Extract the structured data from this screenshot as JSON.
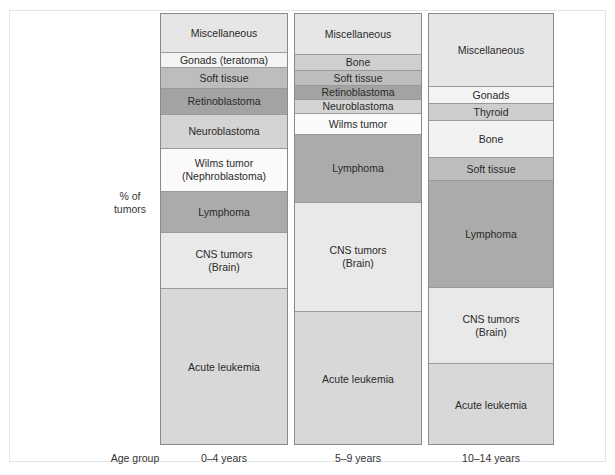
{
  "chart_data": {
    "type": "bar",
    "subtype": "stacked-100-percent",
    "title": "",
    "ylabel": "% of tumors",
    "xlabel": "Age group",
    "categories": [
      "0–4 years",
      "5–9 years",
      "10–14 years"
    ],
    "note": "Values are approximate percentages estimated from segment heights (no axis ticks shown).",
    "columns": [
      {
        "label": "0–4 years",
        "segments": [
          {
            "name": "Miscellaneous",
            "label": "Miscellaneous",
            "value": 9,
            "color": "#e6e6e6"
          },
          {
            "name": "Gonads (teratoma)",
            "label": "Gonads (teratoma)",
            "value": 3.5,
            "color": "#f4f4f4"
          },
          {
            "name": "Soft tissue",
            "label": "Soft tissue",
            "value": 5,
            "color": "#bdbdbd"
          },
          {
            "name": "Retinoblastoma",
            "label": "Retinoblastoma",
            "value": 6,
            "color": "#a3a3a3"
          },
          {
            "name": "Neuroblastoma",
            "label": "Neuroblastoma",
            "value": 8,
            "color": "#d4d4d4"
          },
          {
            "name": "Wilms tumor (Nephroblastoma)",
            "label": "Wilms tumor\n(Nephroblastoma)",
            "value": 10,
            "color": "#fafafa"
          },
          {
            "name": "Lymphoma",
            "label": "Lymphoma",
            "value": 9.5,
            "color": "#ababab"
          },
          {
            "name": "CNS tumors (Brain)",
            "label": "CNS tumors\n(Brain)",
            "value": 13,
            "color": "#e9e9e9"
          },
          {
            "name": "Acute leukemia",
            "label": "Acute leukemia",
            "value": 36,
            "color": "#d8d8d8"
          }
        ]
      },
      {
        "label": "5–9 years",
        "segments": [
          {
            "name": "Miscellaneous",
            "label": "Miscellaneous",
            "value": 9.5,
            "color": "#e6e6e6"
          },
          {
            "name": "Bone",
            "label": "Bone",
            "value": 3.5,
            "color": "#cfcfcf"
          },
          {
            "name": "Soft tissue",
            "label": "Soft tissue",
            "value": 3.5,
            "color": "#bdbdbd"
          },
          {
            "name": "Retinoblastoma",
            "label": "Retinoblastoma",
            "value": 3,
            "color": "#a3a3a3"
          },
          {
            "name": "Neuroblastoma",
            "label": "Neuroblastoma",
            "value": 3,
            "color": "#d4d4d4"
          },
          {
            "name": "Wilms tumor",
            "label": "Wilms tumor",
            "value": 5,
            "color": "#fafafa"
          },
          {
            "name": "Lymphoma",
            "label": "Lymphoma",
            "value": 16,
            "color": "#ababab"
          },
          {
            "name": "CNS tumors (Brain)",
            "label": "CNS tumors\n(Brain)",
            "value": 25,
            "color": "#e9e9e9"
          },
          {
            "name": "Acute leukemia",
            "label": "Acute leukemia",
            "value": 31,
            "color": "#d8d8d8"
          }
        ]
      },
      {
        "label": "10–14 years",
        "segments": [
          {
            "name": "Miscellaneous",
            "label": "Miscellaneous",
            "value": 17,
            "color": "#e6e6e6"
          },
          {
            "name": "Gonads",
            "label": "Gonads",
            "value": 4,
            "color": "#f4f4f4"
          },
          {
            "name": "Thyroid",
            "label": "Thyroid",
            "value": 4,
            "color": "#cdcdcd"
          },
          {
            "name": "Bone",
            "label": "Bone",
            "value": 8.5,
            "color": "#f2f2f2"
          },
          {
            "name": "Soft tissue",
            "label": "Soft tissue",
            "value": 5.5,
            "color": "#bdbdbd"
          },
          {
            "name": "Lymphoma",
            "label": "Lymphoma",
            "value": 24.5,
            "color": "#ababab"
          },
          {
            "name": "CNS tumors (Brain)",
            "label": "CNS tumors\n(Brain)",
            "value": 17.5,
            "color": "#e9e9e9"
          },
          {
            "name": "Acute leukemia",
            "label": "Acute leukemia",
            "value": 19,
            "color": "#d8d8d8"
          }
        ]
      }
    ]
  },
  "axis": {
    "y_label": "% of\ntumors",
    "x_label": "Age group"
  },
  "layout": {
    "columns": [
      {
        "left": 160,
        "width": 128,
        "segment_heights": [
          39,
          15,
          21,
          26,
          34,
          43,
          41,
          56,
          157
        ]
      },
      {
        "left": 294,
        "width": 128,
        "segment_heights": [
          41,
          16,
          15,
          14,
          14,
          21,
          68,
          109,
          134
        ]
      },
      {
        "left": 428,
        "width": 126,
        "segment_heights": [
          73,
          17,
          17,
          37,
          23,
          107,
          76,
          82
        ]
      }
    ]
  }
}
